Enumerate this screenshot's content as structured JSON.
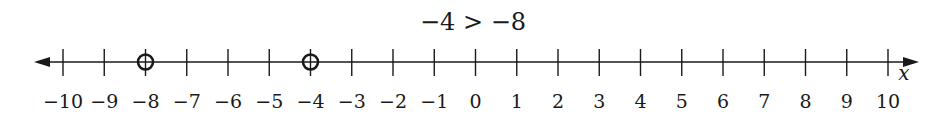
{
  "title": "−4 > −8",
  "axis": {
    "variable": "x",
    "min": -10,
    "max": 10,
    "step": 1,
    "tick_labels": [
      "−10",
      "−9",
      "−8",
      "−7",
      "−6",
      "−5",
      "−4",
      "−3",
      "−2",
      "−1",
      "0",
      "1",
      "2",
      "3",
      "4",
      "5",
      "6",
      "7",
      "8",
      "9",
      "10"
    ],
    "arrows": "both"
  },
  "points": [
    {
      "value": -8,
      "style": "open-circle"
    },
    {
      "value": -4,
      "style": "open-circle"
    }
  ],
  "colors": {
    "line": "#1a1a1a",
    "text": "#1a1a1a",
    "background": "#ffffff"
  },
  "chart_data": {
    "type": "number-line",
    "title": "−4 > −8",
    "xlabel": "x",
    "xlim": [
      -10,
      10
    ],
    "ticks": [
      -10,
      -9,
      -8,
      -7,
      -6,
      -5,
      -4,
      -3,
      -2,
      -1,
      0,
      1,
      2,
      3,
      4,
      5,
      6,
      7,
      8,
      9,
      10
    ],
    "marked_points": [
      {
        "x": -8,
        "marker": "open circle"
      },
      {
        "x": -4,
        "marker": "open circle"
      }
    ],
    "grid": false
  }
}
